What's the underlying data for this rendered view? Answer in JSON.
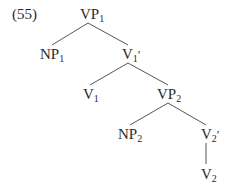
{
  "example_number": "(55)",
  "tree": {
    "nodes": [
      {
        "id": "vp1",
        "base": "VP",
        "sub": "1",
        "prime": "",
        "x": 80,
        "y": 7
      },
      {
        "id": "np1",
        "base": "NP",
        "sub": "1",
        "prime": "",
        "x": 40,
        "y": 47
      },
      {
        "id": "v1bar",
        "base": "V",
        "sub": "1",
        "prime": "′",
        "x": 122,
        "y": 47
      },
      {
        "id": "v1",
        "base": "V",
        "sub": "1",
        "prime": "",
        "x": 83,
        "y": 87
      },
      {
        "id": "vp2",
        "base": "VP",
        "sub": "2",
        "prime": "",
        "x": 157,
        "y": 87
      },
      {
        "id": "np2",
        "base": "NP",
        "sub": "2",
        "prime": "",
        "x": 118,
        "y": 127
      },
      {
        "id": "v2bar",
        "base": "V",
        "sub": "2",
        "prime": "′",
        "x": 201,
        "y": 127
      },
      {
        "id": "v2",
        "base": "V",
        "sub": "2",
        "prime": "",
        "x": 201,
        "y": 167
      }
    ],
    "edges": [
      {
        "from": "vp1",
        "to": "np1",
        "x1": 88,
        "y1": 23,
        "x2": 52,
        "y2": 45
      },
      {
        "from": "vp1",
        "to": "v1bar",
        "x1": 88,
        "y1": 23,
        "x2": 128,
        "y2": 45
      },
      {
        "from": "v1bar",
        "to": "v1",
        "x1": 128,
        "y1": 63,
        "x2": 90,
        "y2": 85
      },
      {
        "from": "v1bar",
        "to": "vp2",
        "x1": 128,
        "y1": 63,
        "x2": 168,
        "y2": 85
      },
      {
        "from": "vp2",
        "to": "np2",
        "x1": 168,
        "y1": 103,
        "x2": 130,
        "y2": 125
      },
      {
        "from": "vp2",
        "to": "v2bar",
        "x1": 168,
        "y1": 103,
        "x2": 206,
        "y2": 125
      },
      {
        "from": "v2bar",
        "to": "v2",
        "x1": 206,
        "y1": 143,
        "x2": 206,
        "y2": 164
      }
    ]
  }
}
